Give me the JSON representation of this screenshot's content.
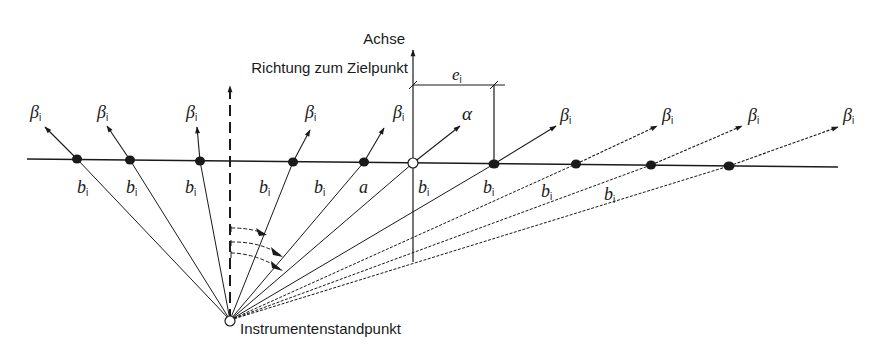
{
  "labels": {
    "axis": "Achse",
    "target_direction": "Richtung zum Zielpunkt",
    "station": "Instrumentenstandpunkt",
    "eccentricity": "e",
    "eccentricity_sub": "i",
    "beta": "β",
    "beta_sub": "i",
    "alpha": "α",
    "b": "b",
    "b_sub": "i",
    "a": "a"
  },
  "geometry": {
    "station": [
      230,
      320
    ],
    "baseline": [
      [
        27,
        159
      ],
      [
        838,
        167
      ]
    ],
    "axis_x": 413,
    "target_direction_x": 230
  },
  "points": [
    {
      "id": "p1",
      "x": 77,
      "y": 159,
      "type": "filled",
      "tip": [
        45,
        127
      ],
      "tip_label": "beta",
      "ray_label": "b",
      "ray_label_pos": [
        80,
        185
      ]
    },
    {
      "id": "p2",
      "x": 130,
      "y": 160,
      "type": "filled",
      "tip": [
        107,
        126
      ],
      "tip_label": "beta",
      "ray_label": "b",
      "ray_label_pos": [
        128,
        185
      ]
    },
    {
      "id": "p3",
      "x": 200,
      "y": 161,
      "type": "filled",
      "tip": [
        197,
        127
      ],
      "tip_label": "beta",
      "ray_label": "b",
      "ray_label_pos": [
        186,
        185
      ]
    },
    {
      "id": "p4",
      "x": 293,
      "y": 162,
      "type": "filled",
      "tip": [
        310,
        130
      ],
      "tip_label": "beta",
      "ray_label": "b",
      "ray_label_pos": [
        261,
        185
      ]
    },
    {
      "id": "p5",
      "x": 364,
      "y": 162,
      "type": "filled",
      "tip": [
        384,
        128
      ],
      "tip_label": "beta",
      "ray_label": "b",
      "ray_label_pos": [
        317,
        185
      ]
    },
    {
      "id": "p0",
      "x": 413,
      "y": 163,
      "type": "open",
      "tip": [
        460,
        126
      ],
      "tip_label": "alpha",
      "ray_label": "a",
      "ray_label_pos": [
        360,
        185
      ]
    },
    {
      "id": "p6",
      "x": 494,
      "y": 164,
      "type": "filled",
      "tip": [
        556,
        126
      ],
      "tip_label": "beta",
      "ray_label": "b",
      "ray_label_pos": [
        418,
        185
      ]
    },
    {
      "id": "p7",
      "x": 576,
      "y": 164,
      "type": "filled",
      "tip": [
        657,
        126
      ],
      "tip_label": "beta",
      "ray_label": "b",
      "ray_label_pos": [
        483,
        185
      ]
    },
    {
      "id": "p8",
      "x": 651,
      "y": 165,
      "type": "filled",
      "tip": [
        742,
        126
      ],
      "tip_label": "beta",
      "ray_label": "b",
      "ray_label_pos": [
        541,
        185
      ]
    },
    {
      "id": "p9",
      "x": 729,
      "y": 166,
      "type": "filled",
      "tip": [
        838,
        127
      ],
      "tip_label": "beta",
      "ray_label": "b",
      "ray_label_pos": [
        604,
        190
      ]
    }
  ],
  "colors": {
    "ink": "#1a1a1a",
    "background": "#ffffff"
  }
}
